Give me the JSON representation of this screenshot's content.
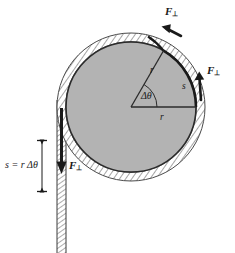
{
  "figure": {
    "type": "physics-diagram",
    "background_color": "#ffffff",
    "disk": {
      "name": "wheel-disk",
      "fill_color": "#b3b3b3",
      "edge_color": "#2b2b2b",
      "center_x": 131,
      "center_y": 107,
      "radius": 65
    },
    "rim": {
      "name": "rope-rim-band",
      "fill_color": "#ffffff",
      "hatch_color": "#555555",
      "outer_radius": 74,
      "inner_radius": 65
    },
    "rope_strand": {
      "name": "vertical-rope",
      "x_left": 57,
      "x_right": 66,
      "top": 107,
      "bottom": 253,
      "fill_color": "#ffffff",
      "hatch_color": "#555555"
    },
    "arc_highlight": {
      "name": "rope-arc-s",
      "color": "#1a1a1a",
      "start_angle_deg": 60,
      "end_angle_deg": 0
    }
  },
  "labels": {
    "force_top": "F",
    "force_top_sub": "⊥",
    "force_right": "F",
    "force_right_sub": "⊥",
    "force_rope": "F",
    "force_rope_sub": "⊥",
    "radius_upper": "r",
    "radius_lower": "r",
    "arc": "s",
    "angle": "Δθ",
    "arc_length_relation": "s = r Δθ"
  },
  "dimension_line": {
    "name": "arc-length-dimension",
    "x": 42,
    "y_top": 140,
    "y_bottom": 192,
    "color": "#1a1a1a",
    "cap_half_width": 5
  },
  "arrows": [
    {
      "name": "force-arrow-top",
      "label": "F⊥",
      "direction": "tangent-left-along-rim",
      "tip_x": 164,
      "tip_y": 27,
      "color": "#1a1a1a"
    },
    {
      "name": "force-arrow-right",
      "label": "F⊥",
      "direction": "tangent-up-along-rim",
      "tip_x": 199,
      "tip_y": 72,
      "color": "#1a1a1a"
    },
    {
      "name": "force-arrow-rope",
      "label": "F⊥",
      "direction": "down-along-rope",
      "tip_x": 61,
      "tip_y": 172,
      "color": "#1a1a1a"
    }
  ]
}
